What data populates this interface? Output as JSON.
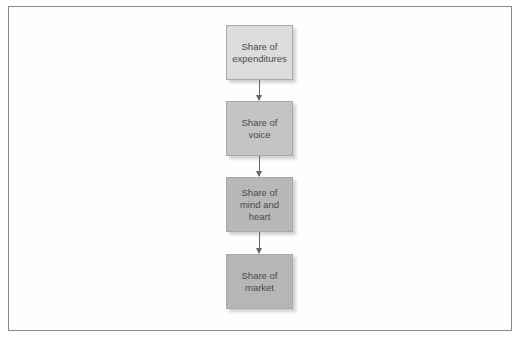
{
  "diagram": {
    "type": "flowchart",
    "direction": "top-to-bottom",
    "nodes": [
      {
        "id": "n1",
        "label": "Share of\nexpenditures",
        "fill": "#dcdcdc"
      },
      {
        "id": "n2",
        "label": "Share of\nvoice",
        "fill": "#c4c4c4"
      },
      {
        "id": "n3",
        "label": "Share of\nmind and\nheart",
        "fill": "#b8b8b8"
      },
      {
        "id": "n4",
        "label": "Share of\nmarket",
        "fill": "#b6b6b6"
      }
    ],
    "edges": [
      {
        "from": "n1",
        "to": "n2"
      },
      {
        "from": "n2",
        "to": "n3"
      },
      {
        "from": "n3",
        "to": "n4"
      }
    ]
  }
}
